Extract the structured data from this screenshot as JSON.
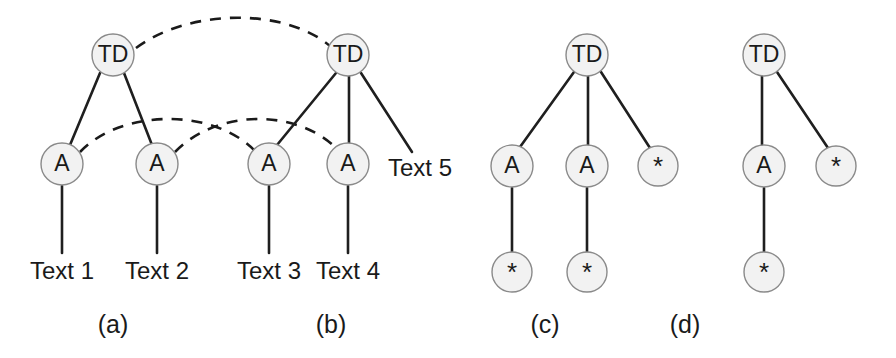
{
  "figure": {
    "width": 896,
    "height": 358,
    "background": "#ffffff",
    "node_fill": "#f2f2f2",
    "node_stroke": "#8a8a8a",
    "edge_color": "#1f1f1f",
    "text_color": "#1a1a1a"
  },
  "panels": [
    {
      "id": "a",
      "caption": "(a)",
      "caption_x": 113,
      "caption_y": 326,
      "nodes": [
        {
          "name": "a-td-root",
          "label": "TD",
          "kind": "td",
          "cx": 113,
          "cy": 55,
          "r": 21
        },
        {
          "name": "a-a-left",
          "label": "A",
          "kind": "a",
          "cx": 62,
          "cy": 164,
          "r": 21
        },
        {
          "name": "a-a-right",
          "label": "A",
          "kind": "a",
          "cx": 157,
          "cy": 164,
          "r": 21
        }
      ],
      "edges": [
        {
          "name": "a-edge-root-left",
          "style": "solid",
          "x1": 100,
          "y1": 73,
          "x2": 70,
          "y2": 145
        },
        {
          "name": "a-edge-root-right",
          "style": "solid",
          "x1": 124,
          "y1": 73,
          "x2": 152,
          "y2": 145
        },
        {
          "name": "a-edge-left-text1",
          "style": "solid",
          "x1": 62,
          "y1": 186,
          "x2": 62,
          "y2": 253
        },
        {
          "name": "a-edge-right-text2",
          "style": "solid",
          "x1": 157,
          "y1": 186,
          "x2": 157,
          "y2": 253
        }
      ],
      "leaves": [
        {
          "name": "a-leaf-text1",
          "label": "Text 1",
          "x": 62,
          "y": 273
        },
        {
          "name": "a-leaf-text2",
          "label": "Text 2",
          "x": 157,
          "y": 273
        }
      ]
    },
    {
      "id": "b",
      "caption": "(b)",
      "caption_x": 331,
      "caption_y": 326,
      "nodes": [
        {
          "name": "b-td-root",
          "label": "TD",
          "kind": "td",
          "cx": 348,
          "cy": 55,
          "r": 21
        },
        {
          "name": "b-a-left",
          "label": "A",
          "kind": "a",
          "cx": 269,
          "cy": 164,
          "r": 21
        },
        {
          "name": "b-a-mid",
          "label": "A",
          "kind": "a",
          "cx": 348,
          "cy": 164,
          "r": 21
        }
      ],
      "edges": [
        {
          "name": "b-edge-root-left",
          "style": "solid",
          "x1": 336,
          "y1": 73,
          "x2": 277,
          "y2": 145
        },
        {
          "name": "b-edge-root-mid",
          "style": "solid",
          "x1": 349,
          "y1": 76,
          "x2": 349,
          "y2": 143
        },
        {
          "name": "b-edge-root-text5",
          "style": "solid",
          "x1": 361,
          "y1": 73,
          "x2": 412,
          "y2": 152
        },
        {
          "name": "b-edge-left-text3",
          "style": "solid",
          "x1": 269,
          "y1": 186,
          "x2": 269,
          "y2": 253
        },
        {
          "name": "b-edge-mid-text4",
          "style": "solid",
          "x1": 348,
          "y1": 186,
          "x2": 348,
          "y2": 253
        }
      ],
      "leaves": [
        {
          "name": "b-leaf-text3",
          "label": "Text 3",
          "x": 269,
          "y": 273
        },
        {
          "name": "b-leaf-text4",
          "label": "Text 4",
          "x": 348,
          "y": 273
        },
        {
          "name": "b-leaf-text5",
          "label": "Text 5",
          "x": 420,
          "y": 170
        }
      ]
    },
    {
      "id": "c",
      "caption": "(c)",
      "caption_x": 545,
      "caption_y": 326,
      "nodes": [
        {
          "name": "c-td-root",
          "label": "TD",
          "kind": "td",
          "cx": 587,
          "cy": 55,
          "r": 21
        },
        {
          "name": "c-a-left",
          "label": "A",
          "kind": "a",
          "cx": 512,
          "cy": 166,
          "r": 21
        },
        {
          "name": "c-a-mid",
          "label": "A",
          "kind": "a",
          "cx": 587,
          "cy": 166,
          "r": 21
        },
        {
          "name": "c-star-right",
          "label": "*",
          "kind": "star",
          "cx": 658,
          "cy": 166,
          "r": 20
        },
        {
          "name": "c-star-under-left",
          "label": "*",
          "kind": "star",
          "cx": 512,
          "cy": 272,
          "r": 20
        },
        {
          "name": "c-star-under-mid",
          "label": "*",
          "kind": "star",
          "cx": 587,
          "cy": 272,
          "r": 20
        }
      ],
      "edges": [
        {
          "name": "c-edge-root-left",
          "style": "solid",
          "x1": 574,
          "y1": 72,
          "x2": 520,
          "y2": 147
        },
        {
          "name": "c-edge-root-mid",
          "style": "solid",
          "x1": 588,
          "y1": 76,
          "x2": 588,
          "y2": 145
        },
        {
          "name": "c-edge-root-right",
          "style": "solid",
          "x1": 601,
          "y1": 72,
          "x2": 650,
          "y2": 148
        },
        {
          "name": "c-edge-left-star",
          "style": "solid",
          "x1": 512,
          "y1": 188,
          "x2": 512,
          "y2": 252
        },
        {
          "name": "c-edge-mid-star",
          "style": "solid",
          "x1": 587,
          "y1": 188,
          "x2": 587,
          "y2": 252
        }
      ],
      "leaves": []
    },
    {
      "id": "d",
      "caption": "(d)",
      "caption_x": 685,
      "caption_y": 326,
      "nodes": [
        {
          "name": "d-td-root",
          "label": "TD",
          "kind": "td",
          "cx": 764,
          "cy": 55,
          "r": 21
        },
        {
          "name": "d-a-mid",
          "label": "A",
          "kind": "a",
          "cx": 764,
          "cy": 166,
          "r": 21
        },
        {
          "name": "d-star-right",
          "label": "*",
          "kind": "star",
          "cx": 836,
          "cy": 166,
          "r": 20
        },
        {
          "name": "d-star-under-mid",
          "label": "*",
          "kind": "star",
          "cx": 764,
          "cy": 272,
          "r": 20
        }
      ],
      "edges": [
        {
          "name": "d-edge-root-mid",
          "style": "solid",
          "x1": 762,
          "y1": 76,
          "x2": 762,
          "y2": 145
        },
        {
          "name": "d-edge-root-right",
          "style": "solid",
          "x1": 777,
          "y1": 72,
          "x2": 828,
          "y2": 148
        },
        {
          "name": "d-edge-mid-star",
          "style": "solid",
          "x1": 764,
          "y1": 188,
          "x2": 764,
          "y2": 252
        }
      ],
      "leaves": []
    }
  ],
  "dashed_links": [
    {
      "name": "dashed-link-td-to-td",
      "from": "a-td-root",
      "to": "b-td-root",
      "path": "M 136 48 C 190 8, 285 8, 330 46"
    },
    {
      "name": "dashed-link-a1-to-a3",
      "from": "a-a-left",
      "to": "b-a-left",
      "path": "M 80 152 C 122 108, 215 108, 256 152"
    },
    {
      "name": "dashed-link-a2-to-a4",
      "from": "a-a-right",
      "to": "b-a-mid",
      "path": "M 175 152 C 218 108, 300 108, 340 152"
    }
  ]
}
